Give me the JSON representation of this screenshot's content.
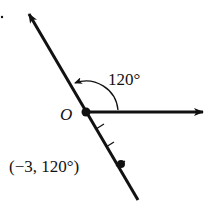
{
  "diagram": {
    "type": "polar-coordinate-plot",
    "origin_label": "O",
    "angle_label": "120°",
    "point_label": "(−3, 120°)",
    "point": {
      "r": -3,
      "theta_deg": 120
    },
    "tick_count": 3,
    "colors": {
      "stroke": "#111111",
      "background": "#ffffff"
    }
  }
}
